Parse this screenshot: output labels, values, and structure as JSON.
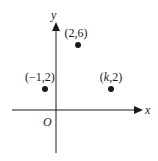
{
  "axes": {
    "x_label": "x",
    "y_label": "y",
    "origin_label": "O"
  },
  "points": [
    {
      "label": "(−1,2)",
      "x": -1,
      "y": 2
    },
    {
      "label": "(2,6)",
      "x": 2,
      "y": 6
    },
    {
      "label": "(k,2)",
      "x": "k",
      "y": 2
    }
  ],
  "colors": {
    "ink": "#1a1a1a",
    "background": "#ffffff"
  }
}
